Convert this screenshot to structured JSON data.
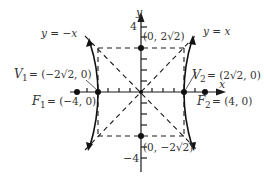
{
  "diagram": {
    "type": "hyperbola",
    "equation_hint": "x^2/8 - y^2/8 = 1",
    "axes": {
      "x_label": "x",
      "y_label": "y",
      "y_tick_top": "4",
      "y_tick_bottom": "−4"
    },
    "asymptotes": [
      {
        "label": "y = −x"
      },
      {
        "label": "y = x"
      }
    ],
    "points": {
      "V1": {
        "name": "V",
        "sub": "1",
        "coords": "= (−2√2, 0)"
      },
      "V2": {
        "name": "V",
        "sub": "2",
        "coords": "= (2√2, 0)"
      },
      "F1": {
        "name": "F",
        "sub": "1",
        "coords": "= (−4, 0)"
      },
      "F2": {
        "name": "F",
        "sub": "2",
        "coords": "= (4, 0)"
      },
      "top": {
        "coords": "(0, 2√2)"
      },
      "bottom": {
        "coords": "(0, −2√2)"
      }
    },
    "colors": {
      "ink": "#1a1a1a",
      "text": "#333333"
    }
  }
}
